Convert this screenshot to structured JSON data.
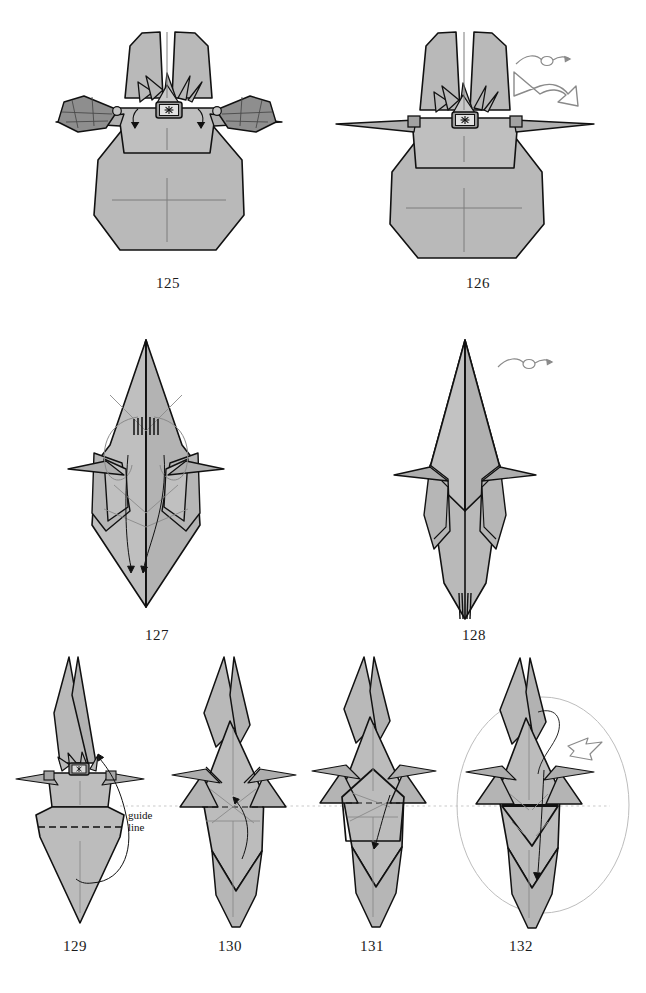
{
  "page": {
    "kind": "origami-instruction-sheet",
    "background_color": "#ffffff",
    "paper_fill": "#b9b9b9",
    "paper_fill_dark": "#8e8e8e",
    "paper_fill_light": "#c9c9c9",
    "line_color": "#111111",
    "crease_color": "#7d7d7d",
    "guide_color": "#bdbdbd"
  },
  "annotations": {
    "guide_line_label": "guide\nline",
    "guide_line_label_line1": "guide",
    "guide_line_label_line2": "line"
  },
  "steps": [
    {
      "number": "125",
      "label_x": 168,
      "label_y": 282,
      "symbols": [
        "fold-arrow-left",
        "fold-arrow-right"
      ],
      "description": "front view with two dark side flaps and crowned head badge"
    },
    {
      "number": "126",
      "label_x": 478,
      "label_y": 282,
      "symbols": [
        "turn-over-symbol",
        "rotate-arrow"
      ],
      "description": "side flaps folded away, wings extended flat"
    },
    {
      "number": "127",
      "label_x": 157,
      "label_y": 634,
      "symbols": [
        "fold-arrow-down"
      ],
      "description": "narrow diamond with loop creases and downward arrows"
    },
    {
      "number": "128",
      "label_x": 474,
      "label_y": 634,
      "symbols": [
        "turn-over-symbol"
      ],
      "description": "narrowed diamond, turned over"
    },
    {
      "number": "129",
      "label_x": 75,
      "label_y": 945,
      "symbols": [
        "fold-arrow-up",
        "valley-fold-dashed"
      ],
      "description": "head with crown badge above body, dashed valley fold and guide line"
    },
    {
      "number": "130",
      "label_x": 230,
      "label_y": 945,
      "symbols": [
        "fold-arrow-up"
      ],
      "description": "body narrowed, creases radiating from center"
    },
    {
      "number": "131",
      "label_x": 372,
      "label_y": 945,
      "symbols": [
        "fold-arrow-down"
      ],
      "description": "pentagon flap formed on body"
    },
    {
      "number": "132",
      "label_x": 521,
      "label_y": 945,
      "symbols": [
        "zoom-circle",
        "rotate-arrow-small",
        "fold-arrow-down"
      ],
      "description": "completed stage inside magnifier circle"
    }
  ]
}
